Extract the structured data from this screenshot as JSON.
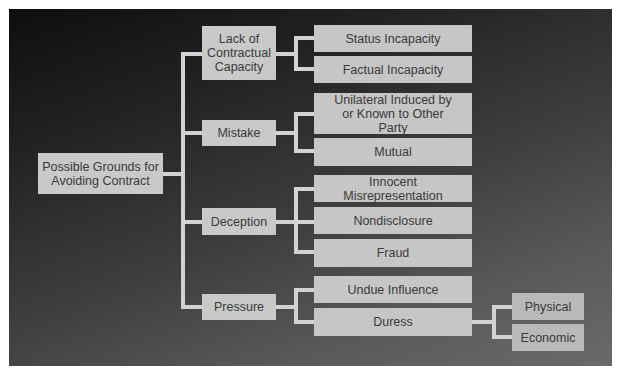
{
  "diagram": {
    "type": "tree",
    "colors": {
      "background_top": "#0e0e0e",
      "background_bottom": "#6a6a6a",
      "box_fill": "#c9c9c9",
      "box_text": "#3a3a3a",
      "connector": "#d2d2d2"
    },
    "root": {
      "label": "Possible Grounds for Avoiding Contract"
    },
    "categories": [
      {
        "label": "Lack of Contractual Capacity",
        "children": [
          {
            "label": "Status Incapacity"
          },
          {
            "label": "Factual Incapacity"
          }
        ]
      },
      {
        "label": "Mistake",
        "children": [
          {
            "label": "Unilateral Induced by or Known to Other Party"
          },
          {
            "label": "Mutual"
          }
        ]
      },
      {
        "label": "Deception",
        "children": [
          {
            "label": "Innocent Misrepresentation"
          },
          {
            "label": "Nondisclosure"
          },
          {
            "label": "Fraud"
          }
        ]
      },
      {
        "label": "Pressure",
        "children": [
          {
            "label": "Undue Influence"
          },
          {
            "label": "Duress",
            "children": [
              {
                "label": "Physical"
              },
              {
                "label": "Economic"
              }
            ]
          }
        ]
      }
    ]
  }
}
